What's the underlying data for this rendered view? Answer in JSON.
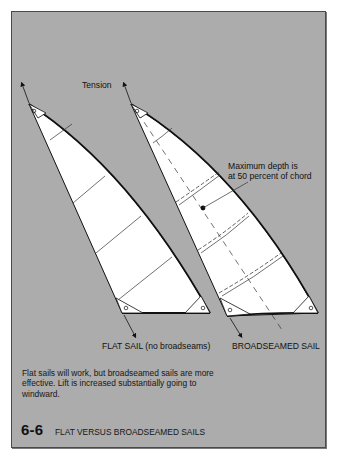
{
  "figure": {
    "number": "6-6",
    "title": "FLAT VERSUS BROADSEAMED SAILS",
    "caption": "Flat sails will work, but broadseamed sails are more effective. Lift is increased substantially going to windward."
  },
  "labels": {
    "tension": "Tension",
    "max_depth_line1": "Maximum depth is",
    "max_depth_line2": "at 50 percent of chord",
    "flat_sail": "FLAT SAIL (no broadseams)",
    "broadseamed_sail": "BROADSEAMED SAIL"
  },
  "colors": {
    "background": "#acacac",
    "sail_fill": "#ffffff",
    "outline": "#111111"
  },
  "diagram": {
    "sails": [
      {
        "name": "flat-sail",
        "panels": 6,
        "broadseams": false
      },
      {
        "name": "broadseamed-sail",
        "panels": 6,
        "broadseams": true,
        "max_depth_percent_of_chord": 50
      }
    ],
    "arrows": [
      "head-tension-arrow-left",
      "head-tension-arrow-right",
      "tack-arrow-left",
      "tack-arrow-right"
    ]
  }
}
